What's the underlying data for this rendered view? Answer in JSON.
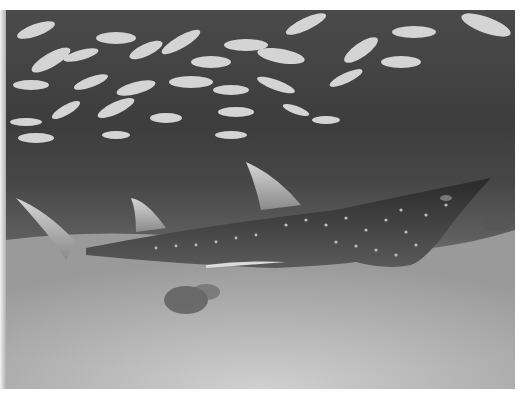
{
  "image": {
    "description": "Grayscale underwater photograph: a spotted shark ray / wedgefish swimming over a sandy seabed beneath a dense school of small silvery fish",
    "subjects": [
      "spotted-wedgefish",
      "school-of-fish",
      "sandy-seabed",
      "dark-rock-patch"
    ],
    "colors": {
      "water": "#3d3d3d",
      "sand": "#c2c2c2",
      "fish": "#d8d8d8",
      "ray_body": "#2e2e2e",
      "border": "#ffffff"
    }
  }
}
